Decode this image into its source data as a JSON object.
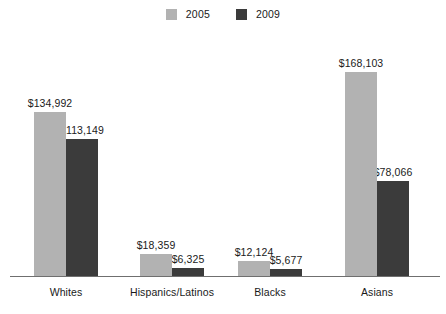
{
  "chart_data": {
    "type": "bar",
    "title": "",
    "xlabel": "",
    "ylabel": "",
    "grid": false,
    "legend_position": "top-center",
    "ylim": [
      0,
      175000
    ],
    "categories": [
      "Whites",
      "Hispanics/Latinos",
      "Blacks",
      "Asians"
    ],
    "series": [
      {
        "name": "2005",
        "color": "#b2b2b2",
        "values": [
          134992,
          18359,
          12124,
          168103
        ],
        "labels": [
          "$134,992",
          "$18,359",
          "$12,124",
          "$168,103"
        ]
      },
      {
        "name": "2009",
        "color": "#3b3b3b",
        "values": [
          113149,
          6325,
          5677,
          78066
        ],
        "labels": [
          "$113,149",
          "$6,325",
          "$5,677",
          "$78,066"
        ]
      }
    ]
  },
  "legend": {
    "entries": [
      {
        "label": "2005",
        "color": "#b2b2b2",
        "swatch_name": "legend-swatch-2005"
      },
      {
        "label": "2009",
        "color": "#3b3b3b",
        "swatch_name": "legend-swatch-2009"
      }
    ]
  },
  "axis": {
    "baseline_color": "#6f6f6f"
  },
  "colors": {
    "series_2005": "#b2b2b2",
    "series_2009": "#3b3b3b",
    "text": "#1a1a1a",
    "background": "#ffffff"
  }
}
